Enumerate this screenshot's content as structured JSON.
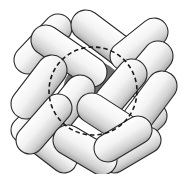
{
  "figure": {
    "width": 183,
    "height": 174,
    "colors": {
      "background": "#ffffff",
      "capsule_light": "#ffffff",
      "capsule_mid": "#e6e6e6",
      "capsule_dark": "#9a9a9a",
      "outline": "#2a2a2a",
      "void": "#6e6e6e",
      "dashed_circle": "#1a1a1a"
    },
    "void": {
      "cx": 93,
      "cy": 91,
      "r": 30
    },
    "dashed_circle": {
      "cx": 93,
      "cy": 91,
      "r": 44
    },
    "capsules": [
      {
        "x1": 28,
        "y1": 60,
        "x2": 58,
        "y2": 28,
        "r": 14
      },
      {
        "x1": 86,
        "y1": 25,
        "x2": 122,
        "y2": 52,
        "r": 15
      },
      {
        "x1": 124,
        "y1": 56,
        "x2": 154,
        "y2": 32,
        "r": 14
      },
      {
        "x1": 24,
        "y1": 130,
        "x2": 44,
        "y2": 110,
        "r": 13
      },
      {
        "x1": 128,
        "y1": 140,
        "x2": 154,
        "y2": 116,
        "r": 13
      },
      {
        "x1": 38,
        "y1": 140,
        "x2": 64,
        "y2": 160,
        "r": 13
      },
      {
        "x1": 114,
        "y1": 160,
        "x2": 148,
        "y2": 140,
        "r": 13
      },
      {
        "x1": 46,
        "y1": 40,
        "x2": 92,
        "y2": 72,
        "r": 15
      },
      {
        "x1": 26,
        "y1": 104,
        "x2": 52,
        "y2": 70,
        "r": 15
      },
      {
        "x1": 136,
        "y1": 82,
        "x2": 158,
        "y2": 56,
        "r": 15
      },
      {
        "x1": 110,
        "y1": 100,
        "x2": 132,
        "y2": 74,
        "r": 15
      },
      {
        "x1": 56,
        "y1": 120,
        "x2": 80,
        "y2": 90,
        "r": 15
      },
      {
        "x1": 138,
        "y1": 118,
        "x2": 162,
        "y2": 86,
        "r": 15
      },
      {
        "x1": 30,
        "y1": 140,
        "x2": 58,
        "y2": 108,
        "r": 14
      },
      {
        "x1": 92,
        "y1": 108,
        "x2": 126,
        "y2": 130,
        "r": 15
      },
      {
        "x1": 68,
        "y1": 140,
        "x2": 102,
        "y2": 160,
        "r": 15
      },
      {
        "x1": 108,
        "y1": 148,
        "x2": 138,
        "y2": 130,
        "r": 14
      }
    ]
  }
}
